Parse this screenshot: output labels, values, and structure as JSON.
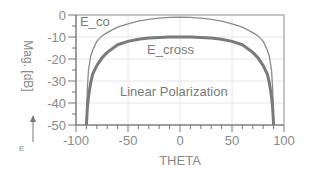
{
  "chart_data": {
    "type": "line",
    "title": "",
    "xlabel": "THETA",
    "ylabel": "Mag. [dB]",
    "xlim": [
      -100,
      100
    ],
    "ylim": [
      -50,
      0
    ],
    "xticks": [
      -100,
      -50,
      0,
      50,
      100
    ],
    "yticks": [
      0,
      -10,
      -20,
      -30,
      -40,
      -50
    ],
    "xtick_labels": [
      "-100",
      "-50",
      "0",
      "50",
      "100"
    ],
    "ytick_labels": [
      "0",
      "-10",
      "-20",
      "-30",
      "-40",
      "-50"
    ],
    "grid": true,
    "annotations": [
      "E_co",
      "E_cross",
      "Linear Polarization"
    ],
    "side_label": "E",
    "series": [
      {
        "name": "E_co",
        "x": [
          -90,
          -89.5,
          -89,
          -88,
          -86,
          -84,
          -80,
          -75,
          -70,
          -60,
          -50,
          -40,
          -30,
          -20,
          -10,
          0,
          10,
          20,
          30,
          40,
          50,
          60,
          70,
          75,
          80,
          84,
          86,
          88,
          89,
          89.5,
          90
        ],
        "values": [
          -50,
          -40,
          -33,
          -25,
          -19,
          -16,
          -12,
          -9.5,
          -8,
          -5.5,
          -4,
          -2.8,
          -2,
          -1.4,
          -1.1,
          -1,
          -1.1,
          -1.4,
          -2,
          -2.8,
          -4,
          -5.5,
          -8,
          -9.5,
          -12,
          -16,
          -19,
          -25,
          -33,
          -40,
          -50
        ]
      },
      {
        "name": "E_cross",
        "x": [
          -90,
          -89.5,
          -89,
          -88,
          -86,
          -84,
          -80,
          -75,
          -70,
          -60,
          -50,
          -40,
          -30,
          -20,
          -10,
          0,
          10,
          20,
          30,
          40,
          50,
          60,
          70,
          75,
          80,
          84,
          86,
          88,
          89,
          89.5,
          90
        ],
        "values": [
          -50,
          -46,
          -42,
          -37,
          -31,
          -27,
          -23,
          -19.5,
          -17,
          -13.5,
          -12,
          -11,
          -10.5,
          -10.2,
          -10,
          -10,
          -10,
          -10.2,
          -10.5,
          -11,
          -12,
          -13.5,
          -17,
          -19.5,
          -23,
          -27,
          -31,
          -37,
          -42,
          -46,
          -50
        ]
      }
    ]
  }
}
